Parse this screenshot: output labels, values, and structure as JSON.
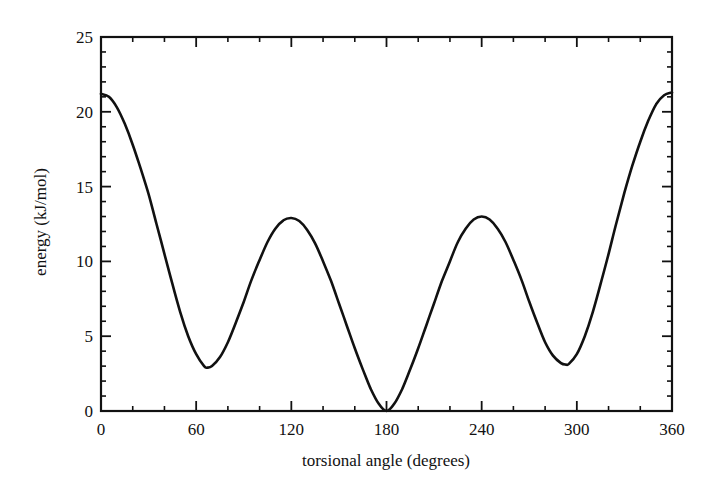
{
  "chart_data": {
    "type": "line",
    "title": "",
    "xlabel": "torsional angle (degrees)",
    "ylabel": "energy (kJ/mol)",
    "xlim": [
      0,
      360
    ],
    "ylim": [
      0,
      25
    ],
    "grid": false,
    "legend": null,
    "x_ticks": [
      0,
      60,
      120,
      180,
      240,
      300,
      360
    ],
    "x_tick_labels": [
      "0",
      "60",
      "120",
      "180",
      "240",
      "300",
      "360"
    ],
    "x_minor_step": 20,
    "y_ticks": [
      0,
      5,
      10,
      15,
      20,
      25
    ],
    "y_tick_labels": [
      "0",
      "5",
      "10",
      "15",
      "20",
      "25"
    ],
    "y_minor_step": 1,
    "series": [
      {
        "name": "torsional energy",
        "color": "#111111",
        "x": [
          0,
          5,
          10,
          15,
          20,
          25,
          30,
          35,
          40,
          45,
          50,
          55,
          60,
          65,
          67,
          70,
          75,
          80,
          85,
          90,
          95,
          100,
          105,
          110,
          115,
          120,
          125,
          130,
          135,
          140,
          145,
          150,
          155,
          160,
          165,
          170,
          175,
          180,
          185,
          190,
          195,
          200,
          205,
          210,
          215,
          220,
          225,
          230,
          235,
          240,
          245,
          250,
          255,
          260,
          265,
          270,
          275,
          280,
          285,
          290,
          293,
          295,
          300,
          305,
          310,
          315,
          320,
          325,
          330,
          335,
          340,
          345,
          350,
          355,
          360
        ],
        "values": [
          21.2,
          21.0,
          20.3,
          19.2,
          17.8,
          16.2,
          14.5,
          12.5,
          10.5,
          8.5,
          6.6,
          5.0,
          3.8,
          3.0,
          2.9,
          3.0,
          3.6,
          4.6,
          5.9,
          7.3,
          8.8,
          10.1,
          11.3,
          12.2,
          12.75,
          12.9,
          12.7,
          12.1,
          11.2,
          10.0,
          8.7,
          7.2,
          5.7,
          4.2,
          2.8,
          1.5,
          0.5,
          0.0,
          0.5,
          1.5,
          2.8,
          4.2,
          5.7,
          7.2,
          8.7,
          10.0,
          11.3,
          12.2,
          12.8,
          13.0,
          12.8,
          12.2,
          11.3,
          10.1,
          8.8,
          7.3,
          5.9,
          4.6,
          3.7,
          3.2,
          3.1,
          3.15,
          3.8,
          5.0,
          6.6,
          8.5,
          10.5,
          12.6,
          14.6,
          16.4,
          18.0,
          19.4,
          20.5,
          21.1,
          21.3
        ]
      }
    ],
    "annotations": [
      {
        "label": "global minimum",
        "x": 180,
        "y": 0.0
      },
      {
        "label": "local minimum",
        "x": 67,
        "y": 2.9
      },
      {
        "label": "local minimum",
        "x": 293,
        "y": 3.1
      },
      {
        "label": "barrier",
        "x": 120,
        "y": 12.9
      },
      {
        "label": "barrier",
        "x": 240,
        "y": 13.0
      },
      {
        "label": "barrier",
        "x": 0,
        "y": 21.2
      }
    ]
  },
  "layout": {
    "plot_left": 101,
    "plot_right": 672,
    "plot_top": 37,
    "plot_bottom": 411
  }
}
